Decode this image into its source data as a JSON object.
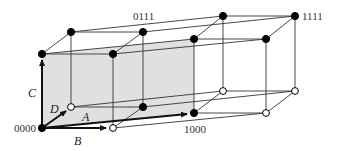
{
  "diagram": {
    "type": "4-cube (tesseract) as two linked 3-cubes",
    "colors": {
      "line": "#333333",
      "shade": "#e0e0e0",
      "node_filled": "#000000",
      "node_open_fill": "#ffffff"
    },
    "node_labels": {
      "origin": "0000",
      "n0111": "0111",
      "n1111": "1111",
      "n1000": "1000"
    },
    "axis_labels": {
      "A": "A",
      "B": "B",
      "C": "C",
      "D": "D"
    },
    "nodes": [
      {
        "id": "0000",
        "x": 42,
        "y": 128,
        "filled": true
      },
      {
        "id": "lb_back_bottom_left",
        "x": 71,
        "y": 107,
        "filled": false
      },
      {
        "id": "lb_front_bottom_right",
        "x": 113,
        "y": 128,
        "filled": false
      },
      {
        "id": "lb_back_bottom_right",
        "x": 143,
        "y": 107,
        "filled": true
      },
      {
        "id": "lb_front_top_left",
        "x": 42,
        "y": 54,
        "filled": true
      },
      {
        "id": "lb_front_top_right",
        "x": 113,
        "y": 54,
        "filled": true
      },
      {
        "id": "lb_back_top_left",
        "x": 71,
        "y": 32,
        "filled": true
      },
      {
        "id": "lb_back_top_right",
        "x": 143,
        "y": 32,
        "filled": true
      },
      {
        "id": "1000",
        "x": 194,
        "y": 113,
        "filled": true
      },
      {
        "id": "rb_back_bottom_left",
        "x": 223,
        "y": 91,
        "filled": false
      },
      {
        "id": "rb_front_bottom_right",
        "x": 266,
        "y": 113,
        "filled": false
      },
      {
        "id": "rb_back_bottom_right",
        "x": 295,
        "y": 91,
        "filled": false
      },
      {
        "id": "rb_front_top_left",
        "x": 194,
        "y": 39,
        "filled": true
      },
      {
        "id": "rb_front_top_right",
        "x": 266,
        "y": 39,
        "filled": true
      },
      {
        "id": "rb_back_top_left",
        "x": 223,
        "y": 16,
        "filled": true
      },
      {
        "id": "1111",
        "x": 295,
        "y": 16,
        "filled": true
      }
    ]
  }
}
